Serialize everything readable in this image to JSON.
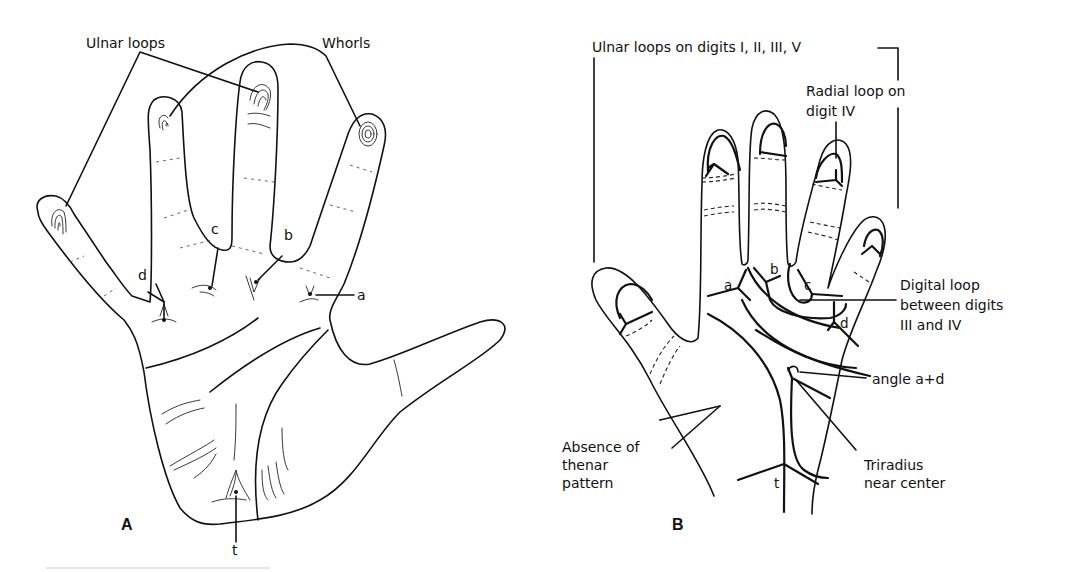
{
  "figure": {
    "panel_a": {
      "panel_label": "A",
      "labels": {
        "ulnar_loops": "Ulnar loops",
        "whorls": "Whorls",
        "triradius_a": "a",
        "triradius_b": "b",
        "triradius_c": "c",
        "triradius_d": "d",
        "triradius_t": "t"
      }
    },
    "panel_b": {
      "panel_label": "B",
      "labels": {
        "ulnar_loops_digits": "Ulnar loops on digits I, II, III, V",
        "radial_loop_line1": "Radial loop on",
        "radial_loop_line2": "digit IV",
        "digital_loop_line1": "Digital loop",
        "digital_loop_line2": "between digits",
        "digital_loop_line3": "III and IV",
        "angle_atd": "angle a+d",
        "thenar_line1": "Absence of",
        "thenar_line2": "thenar",
        "thenar_line3": "pattern",
        "triradius_line1": "Triradius",
        "triradius_line2": "near center",
        "triradius_a": "a",
        "triradius_b": "b",
        "triradius_c": "c",
        "triradius_d": "d",
        "triradius_t": "t"
      }
    }
  }
}
